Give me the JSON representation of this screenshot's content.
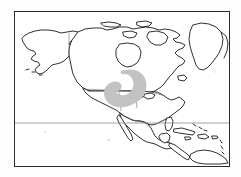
{
  "figure": {
    "type": "range-map",
    "title": "",
    "caption": "",
    "background_color": "#fdfdfd"
  },
  "frame": {
    "border_color": "#2b2b2b",
    "border_width_px": 1,
    "fill_color": "#ffffff",
    "x": 14,
    "y": 11,
    "width": 216,
    "height": 156
  },
  "map": {
    "projection_note": "equirectangular-like",
    "coastline_color": "#1a1a1a",
    "coastline_width_px": 0.9,
    "internal_border_color": "#6e6e6e",
    "internal_border_width_px": 0.6,
    "land_fill": "#ffffff",
    "regions": [
      {
        "name": "alaska",
        "label": ""
      },
      {
        "name": "canada",
        "label": ""
      },
      {
        "name": "greenland",
        "label": ""
      },
      {
        "name": "united-states",
        "label": ""
      },
      {
        "name": "mexico",
        "label": ""
      },
      {
        "name": "central-america",
        "label": ""
      },
      {
        "name": "caribbean-islands",
        "label": ""
      },
      {
        "name": "northern-south-america",
        "label": ""
      }
    ]
  },
  "latitude_line": {
    "name": "tropic-of-cancer",
    "label": "",
    "color": "#8a8a8a",
    "width_px": 0.8,
    "y": 111
  },
  "distribution": {
    "name": "shaded-range-area",
    "label": "",
    "fill_color": "#c2c2c2",
    "stroke_color": "#bdbdbd",
    "shape": "crescent",
    "opacity": 1,
    "location_note": "western interior United States"
  }
}
